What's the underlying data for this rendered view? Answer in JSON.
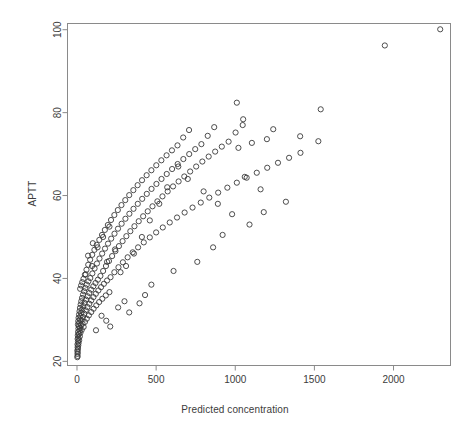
{
  "chart_data": {
    "type": "scatter",
    "title": "",
    "xlabel": "Predicted concentration",
    "ylabel": "APTT",
    "xlim": [
      -60,
      2360
    ],
    "ylim": [
      19.0,
      101.5
    ],
    "xticks": [
      0,
      500,
      1000,
      1500,
      2000
    ],
    "yticks": [
      20,
      40,
      60,
      80,
      100
    ],
    "xtick_labels": [
      "0",
      "500",
      "1000",
      "1500",
      "2000"
    ],
    "ytick_labels": [
      "20",
      "40",
      "60",
      "80",
      "100"
    ],
    "grid": false,
    "legend": null,
    "marker": {
      "shape": "circle-open",
      "size_px": 5.2,
      "stroke": "#3a3a3a",
      "stroke_width": 0.9,
      "fill": "none"
    },
    "frame": {
      "box": true,
      "color": "#8a8a8a",
      "width_px": 1
    },
    "series": [
      {
        "name": "APTT vs predicted concentration",
        "points": [
          [
            2,
            21.0
          ],
          [
            4,
            21.3
          ],
          [
            3,
            21.8
          ],
          [
            5,
            22.2
          ],
          [
            2,
            22.6
          ],
          [
            6,
            23.0
          ],
          [
            4,
            23.4
          ],
          [
            8,
            23.8
          ],
          [
            3,
            24.1
          ],
          [
            10,
            24.4
          ],
          [
            6,
            24.8
          ],
          [
            14,
            25.1
          ],
          [
            4,
            25.4
          ],
          [
            9,
            25.7
          ],
          [
            18,
            26.0
          ],
          [
            5,
            26.3
          ],
          [
            12,
            26.6
          ],
          [
            22,
            26.9
          ],
          [
            7,
            27.1
          ],
          [
            16,
            27.4
          ],
          [
            30,
            27.6
          ],
          [
            9,
            27.9
          ],
          [
            20,
            28.1
          ],
          [
            42,
            28.3
          ],
          [
            11,
            28.5
          ],
          [
            25,
            28.7
          ],
          [
            6,
            28.9
          ],
          [
            35,
            29.1
          ],
          [
            14,
            29.3
          ],
          [
            50,
            29.5
          ],
          [
            8,
            29.7
          ],
          [
            28,
            29.9
          ],
          [
            18,
            30.1
          ],
          [
            62,
            30.3
          ],
          [
            10,
            30.5
          ],
          [
            38,
            30.7
          ],
          [
            22,
            30.9
          ],
          [
            75,
            31.1
          ],
          [
            13,
            31.3
          ],
          [
            46,
            31.5
          ],
          [
            27,
            31.7
          ],
          [
            90,
            31.9
          ],
          [
            16,
            32.1
          ],
          [
            55,
            32.3
          ],
          [
            33,
            32.5
          ],
          [
            105,
            32.7
          ],
          [
            19,
            32.9
          ],
          [
            66,
            33.1
          ],
          [
            40,
            33.3
          ],
          [
            122,
            33.5
          ],
          [
            23,
            33.7
          ],
          [
            78,
            33.9
          ],
          [
            48,
            34.1
          ],
          [
            140,
            34.3
          ],
          [
            27,
            34.5
          ],
          [
            90,
            34.7
          ],
          [
            57,
            34.9
          ],
          [
            160,
            35.1
          ],
          [
            32,
            35.3
          ],
          [
            104,
            35.5
          ],
          [
            67,
            35.7
          ],
          [
            182,
            35.9
          ],
          [
            38,
            36.1
          ],
          [
            119,
            36.3
          ],
          [
            78,
            36.5
          ],
          [
            205,
            36.7
          ],
          [
            45,
            36.9
          ],
          [
            135,
            37.1
          ],
          [
            90,
            37.3
          ],
          [
            20,
            37.5
          ],
          [
            53,
            37.7
          ],
          [
            152,
            37.9
          ],
          [
            103,
            38.1
          ],
          [
            26,
            38.3
          ],
          [
            62,
            38.5
          ],
          [
            170,
            38.7
          ],
          [
            117,
            38.9
          ],
          [
            33,
            39.1
          ],
          [
            72,
            39.3
          ],
          [
            190,
            39.5
          ],
          [
            132,
            39.7
          ],
          [
            41,
            39.9
          ],
          [
            84,
            40.1
          ],
          [
            212,
            40.3
          ],
          [
            148,
            40.6
          ],
          [
            50,
            40.9
          ],
          [
            97,
            41.2
          ],
          [
            236,
            41.5
          ],
          [
            165,
            41.8
          ],
          [
            60,
            42.1
          ],
          [
            111,
            42.4
          ],
          [
            262,
            42.7
          ],
          [
            183,
            43.0
          ],
          [
            71,
            43.3
          ],
          [
            126,
            43.6
          ],
          [
            290,
            43.9
          ],
          [
            202,
            44.2
          ],
          [
            83,
            44.5
          ],
          [
            142,
            44.8
          ],
          [
            320,
            45.1
          ],
          [
            222,
            45.4
          ],
          [
            96,
            45.7
          ],
          [
            159,
            46.0
          ],
          [
            352,
            46.3
          ],
          [
            243,
            46.6
          ],
          [
            110,
            46.9
          ],
          [
            177,
            47.2
          ],
          [
            386,
            47.5
          ],
          [
            265,
            47.8
          ],
          [
            125,
            48.1
          ],
          [
            196,
            48.4
          ],
          [
            422,
            48.7
          ],
          [
            288,
            49.0
          ],
          [
            141,
            49.3
          ],
          [
            216,
            49.6
          ],
          [
            460,
            49.9
          ],
          [
            312,
            50.2
          ],
          [
            158,
            50.5
          ],
          [
            237,
            50.8
          ],
          [
            500,
            51.1
          ],
          [
            337,
            51.4
          ],
          [
            176,
            51.7
          ],
          [
            259,
            52.0
          ],
          [
            542,
            52.3
          ],
          [
            363,
            52.6
          ],
          [
            195,
            52.9
          ],
          [
            282,
            53.2
          ],
          [
            586,
            53.5
          ],
          [
            390,
            53.8
          ],
          [
            215,
            54.1
          ],
          [
            306,
            54.4
          ],
          [
            632,
            54.7
          ],
          [
            418,
            55.0
          ],
          [
            236,
            55.3
          ],
          [
            331,
            55.6
          ],
          [
            680,
            55.9
          ],
          [
            447,
            56.2
          ],
          [
            258,
            56.5
          ],
          [
            357,
            56.8
          ],
          [
            730,
            57.1
          ],
          [
            477,
            57.4
          ],
          [
            281,
            57.7
          ],
          [
            384,
            58.0
          ],
          [
            782,
            58.3
          ],
          [
            508,
            58.6
          ],
          [
            305,
            58.9
          ],
          [
            412,
            59.2
          ],
          [
            836,
            59.5
          ],
          [
            540,
            59.8
          ],
          [
            330,
            60.1
          ],
          [
            441,
            60.4
          ],
          [
            892,
            60.7
          ],
          [
            573,
            61.0
          ],
          [
            356,
            61.3
          ],
          [
            471,
            61.6
          ],
          [
            950,
            61.9
          ],
          [
            607,
            62.2
          ],
          [
            383,
            62.5
          ],
          [
            502,
            62.8
          ],
          [
            1010,
            63.1
          ],
          [
            642,
            63.4
          ],
          [
            411,
            63.7
          ],
          [
            534,
            64.0
          ],
          [
            1072,
            64.3
          ],
          [
            678,
            64.6
          ],
          [
            440,
            64.9
          ],
          [
            567,
            65.2
          ],
          [
            1136,
            65.5
          ],
          [
            715,
            65.8
          ],
          [
            470,
            66.1
          ],
          [
            601,
            66.4
          ],
          [
            1202,
            66.7
          ],
          [
            753,
            67.0
          ],
          [
            501,
            67.3
          ],
          [
            636,
            67.6
          ],
          [
            1270,
            67.9
          ],
          [
            792,
            68.2
          ],
          [
            533,
            68.5
          ],
          [
            672,
            68.8
          ],
          [
            1340,
            69.1
          ],
          [
            832,
            69.4
          ],
          [
            566,
            69.7
          ],
          [
            709,
            70.0
          ],
          [
            1412,
            70.3
          ],
          [
            873,
            70.6
          ],
          [
            600,
            70.9
          ],
          [
            747,
            71.2
          ],
          [
            1020,
            71.5
          ],
          [
            915,
            71.8
          ],
          [
            635,
            72.1
          ],
          [
            786,
            72.4
          ],
          [
            1105,
            72.7
          ],
          [
            958,
            73.0
          ],
          [
            1525,
            73.1
          ],
          [
            1200,
            73.6
          ],
          [
            671,
            74.0
          ],
          [
            826,
            74.4
          ],
          [
            1410,
            74.3
          ],
          [
            1002,
            75.2
          ],
          [
            708,
            75.8
          ],
          [
            867,
            76.5
          ],
          [
            1240,
            76.0
          ],
          [
            1047,
            77.0
          ],
          [
            1050,
            78.4
          ],
          [
            1540,
            80.8
          ],
          [
            1010,
            82.4
          ],
          [
            1945,
            96.2
          ],
          [
            2295,
            100.1
          ],
          [
            155,
            31.0
          ],
          [
            185,
            29.8
          ],
          [
            210,
            28.4
          ],
          [
            120,
            27.5
          ],
          [
            260,
            33.0
          ],
          [
            300,
            34.5
          ],
          [
            330,
            31.8
          ],
          [
            395,
            34.0
          ],
          [
            430,
            36.0
          ],
          [
            470,
            38.5
          ],
          [
            275,
            41.5
          ],
          [
            190,
            44.0
          ],
          [
            240,
            47.0
          ],
          [
            95,
            43.0
          ],
          [
            70,
            45.5
          ],
          [
            55,
            41.0
          ],
          [
            100,
            48.5
          ],
          [
            130,
            47.5
          ],
          [
            165,
            50.0
          ],
          [
            205,
            52.5
          ],
          [
            610,
            41.8
          ],
          [
            760,
            44.0
          ],
          [
            860,
            47.5
          ],
          [
            920,
            50.5
          ],
          [
            1090,
            53.0
          ],
          [
            1180,
            56.0
          ],
          [
            1320,
            58.5
          ],
          [
            1160,
            61.5
          ],
          [
            1060,
            64.5
          ],
          [
            980,
            55.5
          ],
          [
            890,
            58.0
          ],
          [
            800,
            61.0
          ],
          [
            700,
            64.0
          ],
          [
            640,
            67.0
          ],
          [
            570,
            62.0
          ],
          [
            520,
            58.0
          ],
          [
            460,
            54.0
          ],
          [
            410,
            50.0
          ],
          [
            360,
            46.0
          ],
          [
            310,
            43.0
          ]
        ]
      }
    ]
  }
}
